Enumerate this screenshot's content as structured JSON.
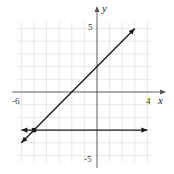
{
  "chart_data": {
    "type": "line",
    "title": "",
    "xlabel": "x",
    "ylabel": "y",
    "xlim": [
      -6,
      4
    ],
    "ylim": [
      -5,
      5
    ],
    "grid": true,
    "tick_labels": {
      "x_min": "-6",
      "x_max": "4",
      "y_max": "5",
      "y_min": "-5"
    },
    "series": [
      {
        "name": "line-1",
        "equation": "y = x + 2",
        "points": [
          [
            -6,
            -4
          ],
          [
            3,
            5
          ]
        ],
        "arrows": "both"
      },
      {
        "name": "line-2",
        "equation": "y = -3",
        "points": [
          [
            -6,
            -3
          ],
          [
            4,
            -3
          ]
        ],
        "arrows": "both"
      }
    ],
    "annotations": [
      {
        "type": "point",
        "x": -5,
        "y": -3,
        "label": ""
      }
    ],
    "colors": {
      "line": "#1a1a1a",
      "grid": "#d9d9d9",
      "axis": "#555555"
    }
  }
}
